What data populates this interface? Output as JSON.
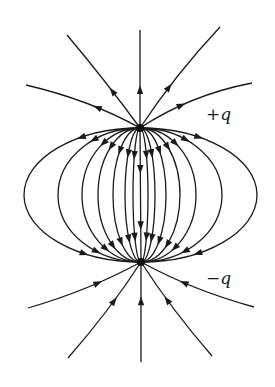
{
  "diagram": {
    "charges": [
      {
        "name": "positive",
        "label": "+q",
        "sign": 1
      },
      {
        "name": "negative",
        "label": "−q",
        "sign": -1
      }
    ],
    "connecting_lines_per_side": 7,
    "center_connecting_line": true,
    "outer_lines_from_positive": 5,
    "outer_lines_into_negative": 5,
    "line_color": "#1a1a1a",
    "background": "#ffffff",
    "arrow_direction": "from +q to -q"
  }
}
